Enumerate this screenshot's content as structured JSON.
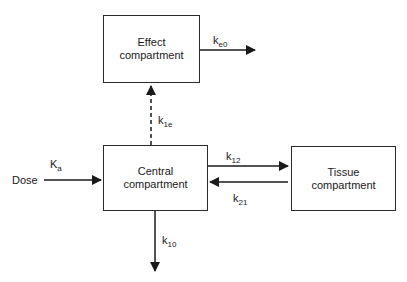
{
  "compartments": {
    "effect": {
      "line1": "Effect",
      "line2": "compartment"
    },
    "central": {
      "line1": "Central",
      "line2": "compartment"
    },
    "tissue": {
      "line1": "Tissue",
      "line2": "compartment"
    }
  },
  "input_label": "Dose",
  "rate_constants": {
    "ka": {
      "base": "K",
      "sub": "a"
    },
    "ke0": {
      "base": "k",
      "sub": "e0"
    },
    "k1e": {
      "base": "k",
      "sub": "1e"
    },
    "k12": {
      "base": "k",
      "sub": "12"
    },
    "k21": {
      "base": "k",
      "sub": "21"
    },
    "k10": {
      "base": "k",
      "sub": "10"
    }
  }
}
